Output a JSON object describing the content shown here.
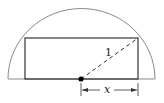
{
  "diagram": {
    "radius_label": "1",
    "half_width_label": "x",
    "colors": {
      "arc": "#8a8a8a",
      "rectangle": "#333333",
      "dashed": "#333333",
      "center_dot": "#000000"
    }
  }
}
